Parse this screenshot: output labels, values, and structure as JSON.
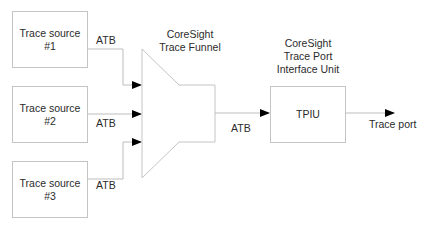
{
  "diagram": {
    "sources": [
      {
        "line1": "Trace source",
        "line2": "#1"
      },
      {
        "line1": "Trace source",
        "line2": "#2"
      },
      {
        "line1": "Trace source",
        "line2": "#3"
      }
    ],
    "bus_label": "ATB",
    "funnel": {
      "line1": "CoreSight",
      "line2": "Trace Funnel"
    },
    "tpiu": {
      "title_line1": "CoreSight",
      "title_line2": "Trace Port",
      "title_line3": "Interface Unit",
      "box_label": "TPIU"
    },
    "output_label": "Trace port",
    "colors": {
      "line": "#bdbdbd",
      "arrow": "#000000",
      "text": "#2b2b2b"
    }
  }
}
